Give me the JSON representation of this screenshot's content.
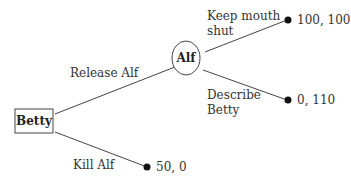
{
  "diagram": {
    "type": "game-tree",
    "nodes": {
      "betty": {
        "label": "Betty",
        "shape": "rectangle"
      },
      "alf": {
        "label": "Alf",
        "shape": "ellipse"
      }
    },
    "edges": {
      "release_alf": {
        "label": "Release Alf",
        "from": "Betty",
        "to": "Alf"
      },
      "kill_alf": {
        "label": "Kill Alf",
        "from": "Betty",
        "to": "terminal"
      },
      "keep_mouth_shut": {
        "label_line1": "Keep mouth",
        "label_line2": "shut",
        "from": "Alf",
        "to": "terminal"
      },
      "describe_betty": {
        "label_line1": "Describe",
        "label_line2": "Betty",
        "from": "Alf",
        "to": "terminal"
      }
    },
    "payoffs": {
      "keep_mouth_shut": "100, 100",
      "describe_betty": "0, 110",
      "kill_alf": "50, 0"
    }
  }
}
